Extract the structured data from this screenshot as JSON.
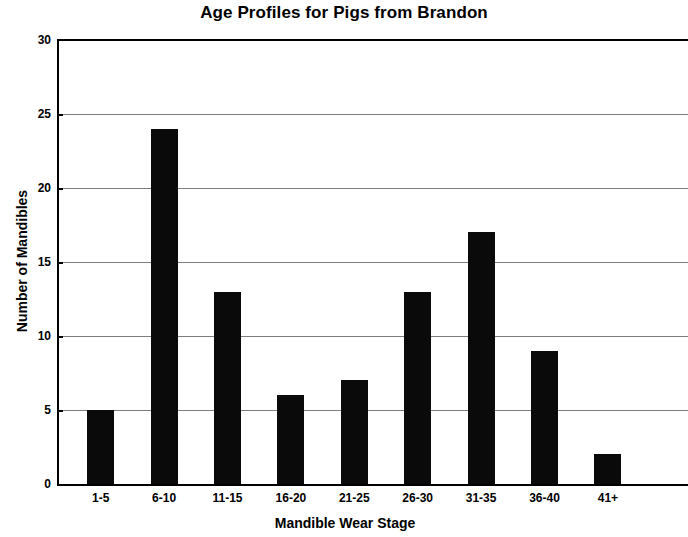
{
  "chart_data": {
    "type": "bar",
    "title": "Age Profiles for Pigs from Brandon",
    "xlabel": "Mandible Wear Stage",
    "ylabel": "Number of Mandibles",
    "categories": [
      "1-5",
      "6-10",
      "11-15",
      "16-20",
      "21-25",
      "26-30",
      "31-35",
      "36-40",
      "41+"
    ],
    "values": [
      5,
      24,
      13,
      6,
      7,
      13,
      17,
      9,
      2
    ],
    "series": [
      {
        "name": "Number of Mandibles",
        "values": [
          5,
          24,
          13,
          6,
          7,
          13,
          17,
          9,
          2
        ]
      }
    ],
    "ylim": [
      0,
      30
    ],
    "ytick_labels": [
      "0",
      "5",
      "10",
      "15",
      "20",
      "25",
      "30"
    ],
    "ytick_values": [
      0,
      5,
      10,
      15,
      20,
      25,
      30
    ],
    "ytick_interval": 5,
    "grid": "horizontal",
    "legend": "none",
    "bar_color": "#0a0a0a",
    "gridline_color": "#7d7d7d",
    "axis_color": "#000000",
    "background_color": "#ffffff"
  }
}
